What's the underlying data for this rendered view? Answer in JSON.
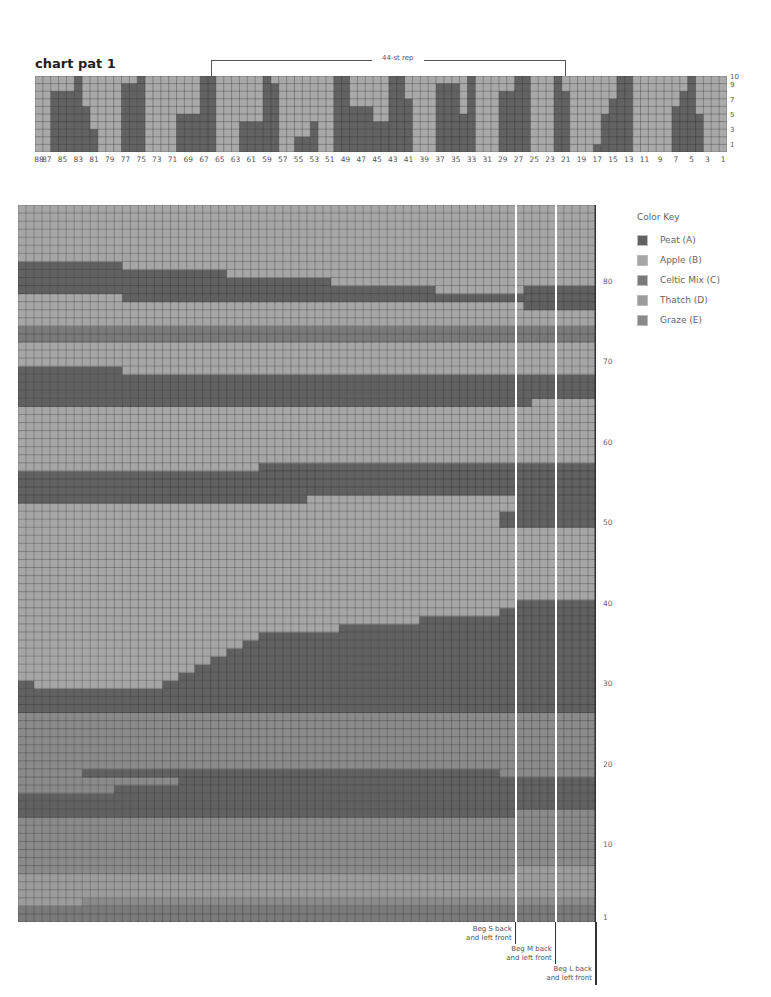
{
  "title": "chart pat 1",
  "repeat_label": "44-st rep",
  "color_key": {
    "title": "Color Key",
    "items": [
      {
        "id": "A",
        "label": "Peat (A)",
        "color": "#616161"
      },
      {
        "id": "B",
        "label": "Apple (B)",
        "color": "#a6a6a6"
      },
      {
        "id": "C",
        "label": "Celtic Mix (C)",
        "color": "#7a7a7a"
      },
      {
        "id": "D",
        "label": "Thatch (D)",
        "color": "#9c9c9c"
      },
      {
        "id": "E",
        "label": "Graze (E)",
        "color": "#8a8a8a"
      }
    ]
  },
  "markers": [
    {
      "label_line1": "Beg S back",
      "label_line2": "and left front"
    },
    {
      "label_line1": "Beg M back",
      "label_line2": "and left front"
    },
    {
      "label_line1": "Beg L back",
      "label_line2": "and left front"
    }
  ],
  "chart_data": [
    {
      "type": "heatmap",
      "title": "chart pat 1",
      "subtitle": "Top colorwork chart, 88 stitches x 10 rows",
      "annotation": "44-st rep",
      "x_tick_labels": [
        "88",
        "87",
        "85",
        "83",
        "81",
        "79",
        "77",
        "75",
        "73",
        "71",
        "69",
        "67",
        "65",
        "63",
        "61",
        "59",
        "57",
        "55",
        "53",
        "51",
        "49",
        "47",
        "45",
        "43",
        "41",
        "39",
        "37",
        "35",
        "33",
        "31",
        "29",
        "27",
        "25",
        "23",
        "21",
        "19",
        "17",
        "15",
        "13",
        "11",
        "9",
        "7",
        "5",
        "3",
        "1"
      ],
      "y_tick_labels": [
        "1",
        "3",
        "5",
        "7",
        "9",
        "10"
      ],
      "columns": 88,
      "rows": 10,
      "dark_color": "#626262",
      "light_color": "#a9a9a9",
      "column_heights_dark_from_bottom_left_to_right": [
        0,
        0,
        8,
        8,
        8,
        10,
        6,
        3,
        0,
        0,
        0,
        9,
        9,
        10,
        0,
        0,
        0,
        0,
        5,
        5,
        5,
        10,
        10,
        0,
        0,
        0,
        4,
        4,
        4,
        10,
        9,
        0,
        0,
        2,
        2,
        4,
        0,
        0,
        10,
        10,
        6,
        6,
        6,
        4,
        4,
        10,
        10,
        7,
        0,
        0,
        0,
        9,
        9,
        9,
        5,
        10,
        0,
        0,
        0,
        8,
        8,
        10,
        10,
        0,
        0,
        0,
        10,
        8,
        0,
        0,
        0,
        1,
        5,
        7,
        10,
        10,
        0,
        0,
        0,
        0,
        0,
        6,
        8,
        10,
        5,
        0,
        0,
        0
      ],
      "column_tops_light_from_top_left_to_right": [
        10,
        10,
        0,
        0,
        0,
        0,
        0,
        0,
        10,
        10,
        10,
        1,
        0,
        0,
        10,
        10,
        10,
        10,
        0,
        0,
        0,
        0,
        0,
        10,
        10,
        10,
        0,
        0,
        0,
        0,
        0,
        10,
        10,
        0,
        0,
        0,
        10,
        10,
        0,
        0,
        0,
        0,
        0,
        0,
        0,
        0,
        0,
        0,
        10,
        10,
        10,
        0,
        0,
        0,
        0,
        0,
        10,
        10,
        10,
        0,
        0,
        0,
        0,
        10,
        10,
        10,
        0,
        0,
        10,
        10,
        10,
        0,
        0,
        0,
        0,
        0,
        10,
        10,
        10,
        10,
        10,
        0,
        0,
        0,
        0,
        10,
        10,
        10
      ]
    },
    {
      "type": "heatmap",
      "title": "Main colorwork chart (rows 1-89)",
      "y_tick_labels": [
        "1",
        "10",
        "20",
        "30",
        "40",
        "50",
        "60",
        "70",
        "80"
      ],
      "columns": 72,
      "rows": 89,
      "size_lines": [
        "Beg S back and left front",
        "Beg M back and left front",
        "Beg L back and left front"
      ],
      "size_line_columns_from_left": [
        62,
        67,
        72
      ],
      "bands": [
        {
          "rows": [
            1,
            2
          ],
          "color": "C",
          "note": "Celtic Mix base"
        },
        {
          "rows": [
            3,
            3
          ],
          "color": "E",
          "split": {
            "col": 8,
            "left": "D",
            "right": "E"
          }
        },
        {
          "rows": [
            4,
            6
          ],
          "color": "D"
        },
        {
          "rows": [
            7,
            13
          ],
          "color": "E"
        },
        {
          "rows": [
            14,
            18
          ],
          "color": "A",
          "note": "Peat band, steps up toward right"
        },
        {
          "rows": [
            19,
            29
          ],
          "color": "E"
        },
        {
          "rows": [
            27,
            30
          ],
          "color": "A",
          "note": "thin Peat band rising diagonally to ~row 40 at right"
        },
        {
          "rows": [
            31,
            49
          ],
          "color": "B",
          "note": "Apple field"
        },
        {
          "rows": [
            50,
            57
          ],
          "color": "A"
        },
        {
          "rows": [
            58,
            64
          ],
          "color": "B"
        },
        {
          "rows": [
            65,
            69
          ],
          "color": "A"
        },
        {
          "rows": [
            70,
            72
          ],
          "color": "B"
        },
        {
          "rows": [
            73,
            74
          ],
          "color": "C"
        },
        {
          "rows": [
            75,
            77
          ],
          "color": "B"
        },
        {
          "rows": [
            78,
            82
          ],
          "color": "A",
          "note": "stepped Peat band"
        },
        {
          "rows": [
            83,
            89
          ],
          "color": "B"
        }
      ]
    }
  ],
  "legend_colors": {
    "peat": "#616161",
    "apple": "#a6a6a6",
    "celtic_mix": "#7a7a7a",
    "thatch": "#9c9c9c",
    "graze": "#8a8a8a"
  }
}
